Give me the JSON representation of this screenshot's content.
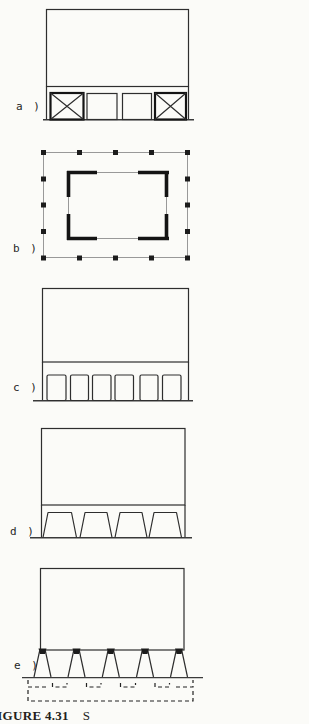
{
  "figure": {
    "panels": [
      {
        "id": "a",
        "label": "a )"
      },
      {
        "id": "b",
        "label": "b )"
      },
      {
        "id": "c",
        "label": "c )"
      },
      {
        "id": "d",
        "label": "d )"
      },
      {
        "id": "e",
        "label": "e )"
      }
    ],
    "caption": {
      "label": "FIGURE 4.31",
      "fragment": "S"
    },
    "colors": {
      "ink": "#2e2e2e",
      "ink_heavy": "#141414",
      "ink_light": "#8f8f8f",
      "background": "#fbfbf8"
    }
  }
}
